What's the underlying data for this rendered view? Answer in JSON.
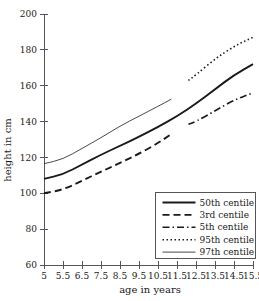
{
  "chart_data": {
    "type": "line",
    "title": "",
    "xlabel": "age in years",
    "ylabel": "height in cm",
    "xlim": [
      5,
      15.5
    ],
    "ylim": [
      60,
      200
    ],
    "grid": false,
    "legend_position": "bottom-right",
    "x_ticks": [
      "5",
      "5.5",
      "6.5",
      "7.5",
      "8.5",
      "9.5",
      "10.5",
      "11.5",
      "12.5",
      "13.5",
      "14.5",
      "15.5"
    ],
    "x_tick_values": [
      5,
      5.5,
      6.5,
      7.5,
      8.5,
      9.5,
      10.5,
      11.5,
      12.5,
      13.5,
      14.5,
      15.5
    ],
    "y_ticks": [
      "60",
      "80",
      "100",
      "120",
      "140",
      "160",
      "180",
      "200"
    ],
    "y_tick_values": [
      60,
      80,
      100,
      120,
      140,
      160,
      180,
      200
    ],
    "series": [
      {
        "name": "50th centile",
        "style": "solid",
        "width": 1.9,
        "dash": "",
        "x": [
          5,
          5.5,
          6.5,
          7.5,
          8.5,
          9.5,
          10.5,
          11.5,
          12.5,
          13.5,
          14.5,
          15.5
        ],
        "values": [
          108,
          110.5,
          116,
          121.5,
          126.5,
          131.5,
          137,
          143,
          150,
          158,
          166,
          172
        ]
      },
      {
        "name": "3rd centile",
        "style": "dashed",
        "width": 1.9,
        "dash": "7,4",
        "x": [
          5,
          5.5,
          6.5,
          7.5,
          8.5,
          9.5,
          10.5,
          11.2
        ],
        "values": [
          100,
          102,
          107,
          112,
          117,
          122,
          128,
          133
        ]
      },
      {
        "name": "5th centile",
        "style": "dash-dot",
        "width": 1.6,
        "dash": "7,3,1.5,3",
        "x": [
          12.1,
          12.5,
          13.5,
          14.5,
          15.5
        ],
        "values": [
          138.5,
          140,
          146,
          152,
          156
        ]
      },
      {
        "name": "95th centile",
        "style": "dotted",
        "width": 1.6,
        "dash": "1.5,2.5",
        "x": [
          12.1,
          12.5,
          13.5,
          14.5,
          15.5
        ],
        "values": [
          163,
          166,
          175,
          182,
          187
        ]
      },
      {
        "name": "97th centile",
        "style": "thin-solid",
        "width": 0.8,
        "dash": "",
        "x": [
          5,
          5.5,
          6.5,
          7.5,
          8.5,
          9.5,
          10.5,
          11.2
        ],
        "values": [
          116.5,
          119,
          125,
          131,
          137.5,
          143,
          148.5,
          152.5
        ]
      }
    ],
    "legend": [
      {
        "label": "50th centile",
        "dash": "",
        "width": 1.9
      },
      {
        "label": "3rd centile",
        "dash": "7,4",
        "width": 1.9
      },
      {
        "label": "5th centile",
        "dash": "7,3,1.5,3",
        "width": 1.6
      },
      {
        "label": "95th centile",
        "dash": "1.5,2.5",
        "width": 1.6
      },
      {
        "label": "97th centile",
        "dash": "",
        "width": 0.8
      }
    ]
  }
}
